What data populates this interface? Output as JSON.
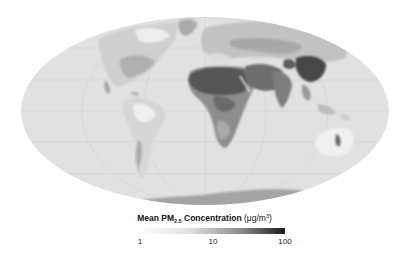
{
  "map": {
    "projection": "mollweide",
    "ellipse": {
      "cx": 205,
      "cy": 111,
      "rx": 184,
      "ry": 94
    },
    "ocean_color": "#e1e1e1",
    "graticule_color": "#d2d2d2",
    "regions": [
      {
        "name": "north-america",
        "shade": "#c9c9c9"
      },
      {
        "name": "greenland",
        "shade": "#aaaaaa"
      },
      {
        "name": "south-america",
        "shade": "#d0d0d0"
      },
      {
        "name": "europe",
        "shade": "#b5b5b5"
      },
      {
        "name": "africa-sahara",
        "shade": "#5a5a5a"
      },
      {
        "name": "central-africa",
        "shade": "#8a8a8a"
      },
      {
        "name": "middle-east",
        "shade": "#6a6a6a"
      },
      {
        "name": "asia",
        "shade": "#9a9a9a"
      },
      {
        "name": "india-china",
        "shade": "#4a4a4a"
      },
      {
        "name": "australia",
        "shade": "#eeeeee"
      },
      {
        "name": "antarctica",
        "shade": "#a3a3a3"
      }
    ]
  },
  "legend": {
    "title_prefix": "Mean PM",
    "title_subscript": "2.5",
    "title_suffix": " Concentration",
    "unit_prefix": " (μg/m",
    "unit_superscript": "3",
    "unit_suffix": ")",
    "scale": "log",
    "min": 1,
    "max": 100,
    "color_low": "#ffffff",
    "color_high": "#1a1a1a",
    "ticks": [
      {
        "label": "1",
        "x": 140
      },
      {
        "label": "10",
        "x": 213
      },
      {
        "label": "100",
        "x": 285
      }
    ]
  }
}
